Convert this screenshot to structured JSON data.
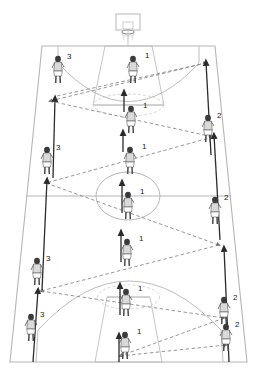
{
  "diagram": {
    "view": "perspective-trapezoid",
    "court_color": "#b9b9b9",
    "arrow_color": "#2b2b2b",
    "pass_line_color": "#8a8a8a",
    "player_color": "#d9d9d9",
    "player_outline": "#5a5a5a",
    "background": "#ffffff"
  },
  "court": {
    "outline_label": "court-boundary",
    "hoop_label": "basketball-hoop",
    "backboard_label": "backboard",
    "center_circle_label": "center-circle",
    "halfcourt_line_label": "halfcourt-line",
    "key_top_label": "key-top",
    "key_bottom_label": "key-bottom",
    "three_point_top_label": "three-point-arc-top",
    "three_point_bottom_label": "three-point-arc-bottom"
  },
  "players": [
    {
      "id": "p1",
      "label": "1",
      "x": 133,
      "y": 72,
      "role": "center-lane",
      "label_dx": 12,
      "label_dy": -14
    },
    {
      "id": "p2",
      "label": "1",
      "x": 131,
      "y": 122,
      "role": "center-lane",
      "label_dx": 12,
      "label_dy": -14
    },
    {
      "id": "p3",
      "label": "1",
      "x": 130,
      "y": 163,
      "role": "center-lane",
      "label_dx": 12,
      "label_dy": -14
    },
    {
      "id": "p4",
      "label": "1",
      "x": 128,
      "y": 208,
      "role": "center-lane",
      "label_dx": 12,
      "label_dy": -14
    },
    {
      "id": "p5",
      "label": "1",
      "x": 127,
      "y": 255,
      "role": "center-lane",
      "label_dx": 12,
      "label_dy": -14
    },
    {
      "id": "p6",
      "label": "1",
      "x": 126,
      "y": 305,
      "role": "center-lane",
      "label_dx": 12,
      "label_dy": -14
    },
    {
      "id": "p7",
      "label": "1",
      "x": 125,
      "y": 348,
      "role": "center-lane",
      "label_dx": 12,
      "label_dy": -14
    },
    {
      "id": "p8",
      "label": "3",
      "x": 58,
      "y": 72,
      "role": "left-wing",
      "label_dx": 9,
      "label_dy": -13
    },
    {
      "id": "p9",
      "label": "3",
      "x": 47,
      "y": 163,
      "role": "left-wing",
      "label_dx": 9,
      "label_dy": -13
    },
    {
      "id": "p10",
      "label": "3",
      "x": 37,
      "y": 274,
      "role": "left-wing",
      "label_dx": 9,
      "label_dy": -13
    },
    {
      "id": "p11",
      "label": "3",
      "x": 31,
      "y": 330,
      "role": "left-wing",
      "label_dx": 9,
      "label_dy": -13
    },
    {
      "id": "p12",
      "label": "2",
      "x": 208,
      "y": 131,
      "role": "right-wing",
      "label_dx": 9,
      "label_dy": -13
    },
    {
      "id": "p13",
      "label": "2",
      "x": 215,
      "y": 213,
      "role": "right-wing",
      "label_dx": 9,
      "label_dy": -13
    },
    {
      "id": "p14",
      "label": "2",
      "x": 224,
      "y": 313,
      "role": "right-wing",
      "label_dx": 9,
      "label_dy": -13
    },
    {
      "id": "p15",
      "label": "2",
      "x": 226,
      "y": 340,
      "role": "right-wing",
      "label_dx": 9,
      "label_dy": -13
    }
  ],
  "movement_arrows": [
    {
      "id": "a1",
      "x1": 124,
      "y1": 112,
      "x2": 124,
      "y2": 92,
      "desc": "center-lane-cut-1"
    },
    {
      "id": "a2",
      "x2": 123,
      "y2": 132,
      "x1": 123,
      "y1": 152,
      "desc": "center-lane-cut-2"
    },
    {
      "id": "a3",
      "x1": 122,
      "y1": 213,
      "x2": 122,
      "y2": 182,
      "desc": "center-lane-cut-3"
    },
    {
      "id": "a4",
      "x1": 121,
      "y1": 262,
      "x2": 121,
      "y2": 232,
      "desc": "center-lane-cut-4"
    },
    {
      "id": "a5",
      "x1": 120,
      "y1": 315,
      "x2": 120,
      "y2": 285,
      "desc": "center-lane-cut-5"
    },
    {
      "id": "a6",
      "x1": 119,
      "y1": 362,
      "x2": 119,
      "y2": 335,
      "desc": "center-lane-cut-6"
    },
    {
      "id": "a7",
      "x1": 53,
      "y1": 178,
      "x2": 55,
      "y2": 98,
      "desc": "left-wing-run-up-1"
    },
    {
      "id": "a8",
      "x1": 42,
      "y1": 290,
      "x2": 47,
      "y2": 180,
      "desc": "left-wing-run-up-2"
    },
    {
      "id": "a9",
      "x1": 33,
      "y1": 362,
      "x2": 38,
      "y2": 290,
      "desc": "left-wing-run-up-3"
    },
    {
      "id": "a10",
      "x1": 211,
      "y1": 155,
      "x2": 206,
      "y2": 62,
      "desc": "right-wing-run-up-1"
    },
    {
      "id": "a11",
      "x1": 220,
      "y1": 240,
      "x2": 214,
      "y2": 135,
      "desc": "right-wing-run-up-2"
    },
    {
      "id": "a12",
      "x1": 229,
      "y1": 362,
      "x2": 224,
      "y2": 248,
      "desc": "right-wing-run-up-3"
    }
  ],
  "pass_lines": [
    {
      "id": "ps1",
      "points": "57,96 206,63",
      "desc": "pass-left-to-right-top"
    },
    {
      "id": "ps2",
      "points": "206,63 50,101",
      "desc": "pass-right-to-left-upper"
    },
    {
      "id": "ps3",
      "points": "50,101 213,137",
      "desc": "pass-left-to-right-upper-mid"
    },
    {
      "id": "ps4",
      "points": "213,137 46,183",
      "desc": "pass-right-to-left-mid"
    },
    {
      "id": "ps5",
      "points": "46,183 219,245",
      "desc": "pass-left-to-right-lower-mid"
    },
    {
      "id": "ps6",
      "points": "219,245 41,291",
      "desc": "pass-right-to-left-lower"
    },
    {
      "id": "ps7",
      "points": "41,291 224,318",
      "desc": "pass-left-to-right-bottom"
    },
    {
      "id": "ps8",
      "points": "224,318 120,356",
      "desc": "pass-right-to-center-bottom"
    },
    {
      "id": "ps9",
      "points": "120,356 226,345",
      "desc": "pass-center-to-right-baseline"
    }
  ]
}
